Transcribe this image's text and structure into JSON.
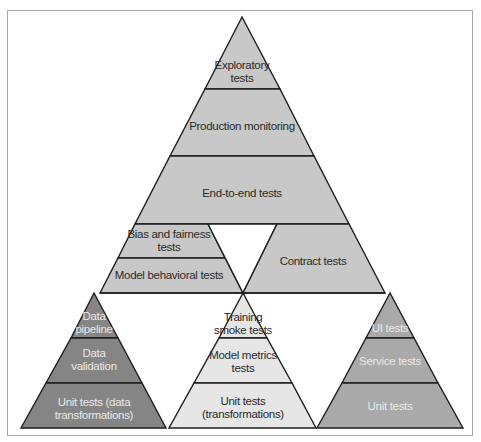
{
  "diagram": {
    "colors": {
      "light_fill": "#c8c8c8",
      "lighter_fill": "#e6e6e6",
      "medium_fill": "#a9a9a9",
      "dark_fill": "#858585",
      "stroke": "#1e1e1e",
      "frame": "#a8a8a8"
    },
    "main_pyramid": {
      "layers": [
        {
          "label": "Exploratory\ntests",
          "line1": "Exploratory",
          "line2": "tests"
        },
        {
          "label": "Production monitoring"
        },
        {
          "label": "End-to-end tests"
        }
      ]
    },
    "middle_row": {
      "left": [
        {
          "line1": "Bias and fairness",
          "line2": "tests"
        },
        {
          "label": "Model behavioral tests"
        }
      ],
      "right": {
        "label": "Contract tests"
      }
    },
    "bottom_row": {
      "data_pyramid": [
        {
          "line1": "Data",
          "line2": "pipeline"
        },
        {
          "line1": "Data",
          "line2": "validation"
        },
        {
          "line1": "Unit tests (data",
          "line2": "transformations)"
        }
      ],
      "model_pyramid": [
        {
          "line1": "Training",
          "line2": "smoke tests"
        },
        {
          "line1": "Model metrics",
          "line2": "tests"
        },
        {
          "line1": "Unit tests",
          "line2": "(transformations)"
        }
      ],
      "software_pyramid": [
        {
          "label": "UI tests"
        },
        {
          "label": "Service tests"
        },
        {
          "label": "Unit tests"
        }
      ]
    }
  }
}
